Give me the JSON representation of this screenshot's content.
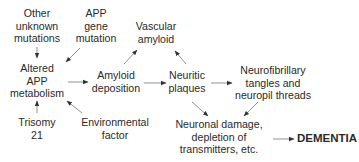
{
  "diagram": {
    "nodes": {
      "other_mutations": {
        "lines": [
          "Other",
          "unknown",
          "mutations"
        ]
      },
      "app_gene": {
        "lines": [
          "APP",
          "gene",
          "mutation"
        ]
      },
      "vascular_amyloid": {
        "lines": [
          "Vascular",
          "amyloid"
        ]
      },
      "altered_app": {
        "lines": [
          "Altered",
          "APP",
          "metabolism"
        ]
      },
      "amyloid_deposition": {
        "lines": [
          "Amyloid",
          "deposition"
        ]
      },
      "neuritic_plaques": {
        "lines": [
          "Neuritic",
          "plaques"
        ]
      },
      "neurofibrillary": {
        "lines": [
          "Neurofibrillary",
          "tangles and",
          "neuropil threads"
        ]
      },
      "trisomy": {
        "lines": [
          "Trisomy",
          "21"
        ]
      },
      "environmental": {
        "lines": [
          "Environmental",
          "factor"
        ]
      },
      "neuronal_damage": {
        "lines": [
          "Neuronal damage,",
          "depletion of",
          "transmitters, etc."
        ]
      },
      "dementia": {
        "lines": [
          "DEMENTIA"
        ]
      }
    },
    "edges": [
      {
        "from": "Other unknown mutations",
        "to": "Altered APP metabolism"
      },
      {
        "from": "APP gene mutation",
        "to": "Altered APP metabolism"
      },
      {
        "from": "Trisomy 21",
        "to": "Altered APP metabolism"
      },
      {
        "from": "Environmental factor",
        "to": "Altered APP metabolism"
      },
      {
        "from": "Altered APP metabolism",
        "to": "Amyloid deposition"
      },
      {
        "from": "Amyloid deposition",
        "to": "Vascular amyloid"
      },
      {
        "from": "Amyloid deposition",
        "to": "Neuritic plaques"
      },
      {
        "from": "Neuritic plaques",
        "to": "Vascular amyloid"
      },
      {
        "from": "Neuritic plaques",
        "to": "Neurofibrillary tangles and neuropil threads"
      },
      {
        "from": "Neuritic plaques",
        "to": "Neuronal damage, depletion of transmitters, etc."
      },
      {
        "from": "Neurofibrillary tangles and neuropil threads",
        "to": "Neuronal damage, depletion of transmitters, etc."
      },
      {
        "from": "Neuronal damage, depletion of transmitters, etc.",
        "to": "DEMENTIA"
      }
    ],
    "colors": {
      "text": "#2a2a2a",
      "arrow": "#555555"
    }
  }
}
